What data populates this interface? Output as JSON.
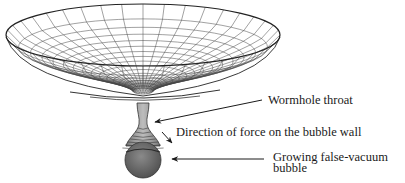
{
  "figure": {
    "type": "diagram",
    "labels": {
      "throat": "Wormhole throat",
      "force": "Direction of force on the bubble wall",
      "bubble_line1": "Growing false-vacuum",
      "bubble_line2": "bubble"
    },
    "colors": {
      "grid": "#444444",
      "rim": "#222222",
      "neck_fill": "#9a9a9a",
      "bubble_fill": "#6a6a6a",
      "text": "#1a1a1a"
    }
  }
}
